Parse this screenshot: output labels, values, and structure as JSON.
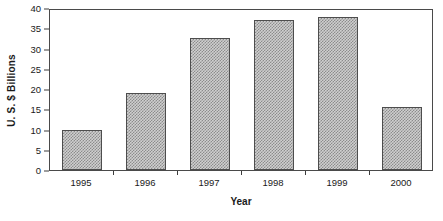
{
  "chart_data": {
    "type": "bar",
    "title": "",
    "subtitle": "",
    "xlabel": "Year",
    "ylabel": "U. S. $ Billions",
    "categories": [
      "1995",
      "1996",
      "1997",
      "1998",
      "1999",
      "2000"
    ],
    "values": [
      9.8,
      19.0,
      32.5,
      37.0,
      37.8,
      15.5
    ],
    "series": [
      {
        "name": "U. S. $ Billions",
        "values": [
          9.8,
          19.0,
          32.5,
          37.0,
          37.8,
          15.5
        ]
      }
    ],
    "ylim": [
      0,
      40
    ],
    "xlim": [
      0,
      6
    ],
    "y_ticks": [
      0,
      5,
      10,
      15,
      20,
      25,
      30,
      35,
      40
    ],
    "y_tick_labels": [
      "0",
      "5",
      "10",
      "15",
      "20",
      "25",
      "30",
      "35",
      "40"
    ],
    "x_tick_labels": [
      "1995",
      "1996",
      "1997",
      "1998",
      "1999",
      "2000"
    ],
    "grid": false,
    "legend": false,
    "legend_position": "none",
    "annotations": [],
    "colors": {
      "bar_fill": "#cfcfcf",
      "bar_pattern": "#8c8c8c",
      "bar_border": "#4d4d4d",
      "axis": "#4a4a4a",
      "text": "#1a1a1a",
      "background": "#ffffff"
    }
  }
}
